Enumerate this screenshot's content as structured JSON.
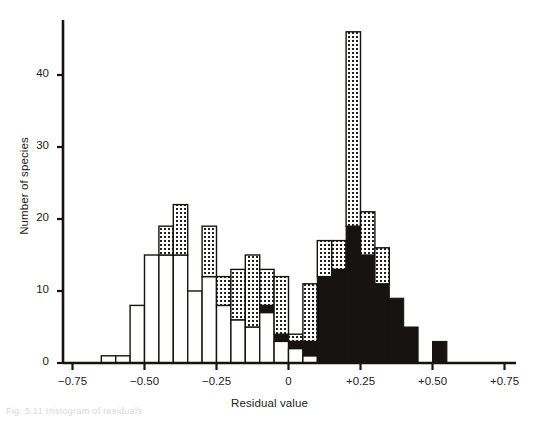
{
  "chart_data": {
    "type": "bar",
    "title": "",
    "xlabel": "Residual value",
    "ylabel": "Number of species",
    "xlim": [
      -0.75,
      0.75
    ],
    "ylim": [
      0,
      47
    ],
    "bin_width": 0.05,
    "xticks": [
      "-0.75",
      "-0.50",
      "-0.25",
      "0",
      "+0.25",
      "+0.50",
      "+0.75"
    ],
    "xtick_values": [
      -0.75,
      -0.5,
      -0.25,
      0,
      0.25,
      0.5,
      0.75
    ],
    "yticks": [
      "0",
      "10",
      "20",
      "30",
      "40"
    ],
    "ytick_values": [
      0,
      10,
      20,
      30,
      40
    ],
    "grid": false,
    "legend": [
      {
        "key": "white",
        "label": "open"
      },
      {
        "key": "stipple",
        "label": "stippled"
      },
      {
        "key": "black",
        "label": "filled"
      }
    ],
    "series": [
      {
        "name": "open",
        "key": "white"
      },
      {
        "name": "stippled",
        "key": "stipple"
      },
      {
        "name": "filled",
        "key": "black"
      }
    ],
    "bins": [
      {
        "x0": -0.65,
        "white": 1,
        "stipple": 0,
        "black": 0
      },
      {
        "x0": -0.6,
        "white": 1,
        "stipple": 0,
        "black": 0
      },
      {
        "x0": -0.55,
        "white": 8,
        "stipple": 0,
        "black": 0
      },
      {
        "x0": -0.5,
        "white": 15,
        "stipple": 0,
        "black": 0
      },
      {
        "x0": -0.45,
        "white": 15,
        "stipple": 4,
        "black": 0
      },
      {
        "x0": -0.4,
        "white": 15,
        "stipple": 7,
        "black": 0
      },
      {
        "x0": -0.35,
        "white": 10,
        "stipple": 0,
        "black": 0
      },
      {
        "x0": -0.3,
        "white": 12,
        "stipple": 7,
        "black": 0
      },
      {
        "x0": -0.25,
        "white": 8,
        "stipple": 4,
        "black": 0
      },
      {
        "x0": -0.2,
        "white": 6,
        "stipple": 7,
        "black": 0
      },
      {
        "x0": -0.15,
        "white": 5,
        "stipple": 10,
        "black": 0
      },
      {
        "x0": -0.1,
        "white": 7,
        "stipple": 5,
        "black": 1
      },
      {
        "x0": -0.05,
        "white": 3,
        "stipple": 8,
        "black": 1
      },
      {
        "x0": 0.0,
        "white": 2,
        "stipple": 1,
        "black": 1
      },
      {
        "x0": 0.05,
        "white": 1,
        "stipple": 8,
        "black": 2
      },
      {
        "x0": 0.1,
        "white": 0,
        "stipple": 5,
        "black": 12
      },
      {
        "x0": 0.15,
        "white": 0,
        "stipple": 4,
        "black": 13
      },
      {
        "x0": 0.2,
        "white": 0,
        "stipple": 27,
        "black": 19
      },
      {
        "x0": 0.25,
        "white": 0,
        "stipple": 6,
        "black": 15
      },
      {
        "x0": 0.3,
        "white": 0,
        "stipple": 5,
        "black": 11
      },
      {
        "x0": 0.35,
        "white": 0,
        "stipple": 0,
        "black": 9
      },
      {
        "x0": 0.4,
        "white": 0,
        "stipple": 0,
        "black": 5
      },
      {
        "x0": 0.45,
        "white": 0,
        "stipple": 0,
        "black": 0
      },
      {
        "x0": 0.5,
        "white": 0,
        "stipple": 0,
        "black": 3
      }
    ]
  },
  "caption_ghost": "Fig. 5.11  Histogram of residuals"
}
